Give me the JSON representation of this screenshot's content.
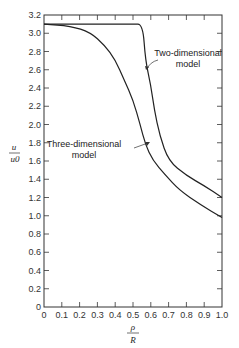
{
  "chart_data": {
    "type": "line",
    "title": "",
    "xlabel": "ρ / R",
    "ylabel": "u / u0",
    "xlim": [
      0,
      1.0
    ],
    "ylim": [
      0,
      3.2
    ],
    "grid": false,
    "x_ticks": [
      "0",
      "0.1",
      "0.2",
      "0.3",
      "0.4",
      "0.5",
      "0.6",
      "0.7",
      "0.8",
      "0.9",
      "1.0"
    ],
    "y_ticks": [
      "0",
      "0.2",
      "0.4",
      "0.6",
      "0.8",
      "1.0",
      "1.2",
      "1.4",
      "1.6",
      "1.8",
      "2.0",
      "2.2",
      "2.4",
      "2.6",
      "2.8",
      "3.0",
      "3.2"
    ],
    "series": [
      {
        "name": "Two-dimensional model",
        "x": [
          0,
          0.1,
          0.2,
          0.3,
          0.4,
          0.5,
          0.555,
          0.57,
          0.6,
          0.62,
          0.65,
          0.7,
          0.8,
          0.9,
          1.0
        ],
        "y": [
          3.1,
          3.1,
          3.1,
          3.1,
          3.1,
          3.1,
          3.1,
          2.7,
          2.43,
          2.16,
          1.88,
          1.6,
          1.44,
          1.33,
          1.2
        ]
      },
      {
        "name": "Three-dimensional model",
        "x": [
          0,
          0.15,
          0.26,
          0.34,
          0.4,
          0.45,
          0.5,
          0.54,
          0.57,
          0.61,
          0.68,
          0.76,
          0.88,
          1.0
        ],
        "y": [
          3.1,
          3.08,
          3.01,
          2.87,
          2.71,
          2.49,
          2.27,
          2.0,
          1.78,
          1.61,
          1.45,
          1.28,
          1.12,
          0.98
        ]
      }
    ],
    "annotations": [
      {
        "text_line1": "Two-dimensional",
        "text_line2": "model",
        "points_to_series": "Two-dimensional model"
      },
      {
        "text_line1": "Three-dimensional",
        "text_line2": "model",
        "points_to_series": "Three-dimensional model"
      }
    ]
  },
  "labels": {
    "ylabel_num": "u",
    "ylabel_den": "u0",
    "xlabel_num": "ρ",
    "xlabel_den": "R",
    "two_dim_1": "Two-dimensional",
    "two_dim_2": "model",
    "three_dim_1": "Three-dimensional",
    "three_dim_2": "model"
  }
}
